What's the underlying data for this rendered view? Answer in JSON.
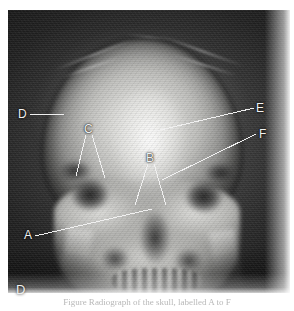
{
  "figure": {
    "panel_letter": "D",
    "modality": "skull-radiograph",
    "view": "frontal-ap",
    "caption": "Figure   Radiograph of the skull, labelled A to F",
    "caption_visible": "partially-clipped"
  },
  "annotations": {
    "items": [
      {
        "id": "A",
        "label": "A",
        "label_x": 24,
        "label_y": 229,
        "leaders": [
          {
            "x1": 35,
            "y1": 236,
            "x2": 152,
            "y2": 209
          }
        ]
      },
      {
        "id": "B",
        "label": "B",
        "label_x": 146,
        "label_y": 152,
        "leaders": [
          {
            "x1": 148,
            "y1": 164,
            "x2": 135,
            "y2": 205
          },
          {
            "x1": 154,
            "y1": 164,
            "x2": 166,
            "y2": 205
          }
        ]
      },
      {
        "id": "C",
        "label": "C",
        "label_x": 84,
        "label_y": 123,
        "leaders": [
          {
            "x1": 86,
            "y1": 135,
            "x2": 76,
            "y2": 176
          },
          {
            "x1": 92,
            "y1": 135,
            "x2": 105,
            "y2": 178
          }
        ]
      },
      {
        "id": "D",
        "label": "D",
        "label_x": 18,
        "label_y": 108,
        "leaders": [
          {
            "x1": 30,
            "y1": 114,
            "x2": 64,
            "y2": 114
          }
        ]
      },
      {
        "id": "E",
        "label": "E",
        "label_x": 256,
        "label_y": 102,
        "leaders": [
          {
            "x1": 254,
            "y1": 108,
            "x2": 156,
            "y2": 131
          }
        ]
      },
      {
        "id": "F",
        "label": "F",
        "label_x": 259,
        "label_y": 128,
        "leaders": [
          {
            "x1": 256,
            "y1": 134,
            "x2": 162,
            "y2": 180
          }
        ]
      }
    ]
  },
  "colors": {
    "page_background": "#ffffff",
    "film_dark": "#141414",
    "bone_bright": "#e6e6e4",
    "annotation_text": "#f2f2f2",
    "leader_line": "#f0f0f0",
    "caption_text": "#7c7c7c"
  },
  "geometry": {
    "image_width": 294,
    "image_height": 311,
    "plate_x": 8,
    "plate_y": 10,
    "plate_width": 282,
    "plate_height": 283
  }
}
